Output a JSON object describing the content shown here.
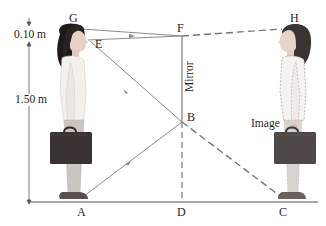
{
  "diagram": {
    "points": {
      "G": "G",
      "E": "E",
      "F": "F",
      "H": "H",
      "B": "B",
      "A": "A",
      "D": "D",
      "C": "C"
    },
    "labels": {
      "mirror": "Mirror",
      "image": "Image"
    },
    "dimensions": {
      "eye_to_top": "0.10 m",
      "eye_to_floor": "1.50 m"
    },
    "colors": {
      "ray": "#8a8a8a",
      "mirror_line": "#7a7a7a",
      "dashed": "#777777",
      "floor": "#555555",
      "hair": "#1e1a18",
      "skin": "#e7d2c5",
      "shirt": "#f3f0ee",
      "pants": "#c9c5c1",
      "briefcase": "#3a3230",
      "shoe": "#5a504c"
    }
  }
}
